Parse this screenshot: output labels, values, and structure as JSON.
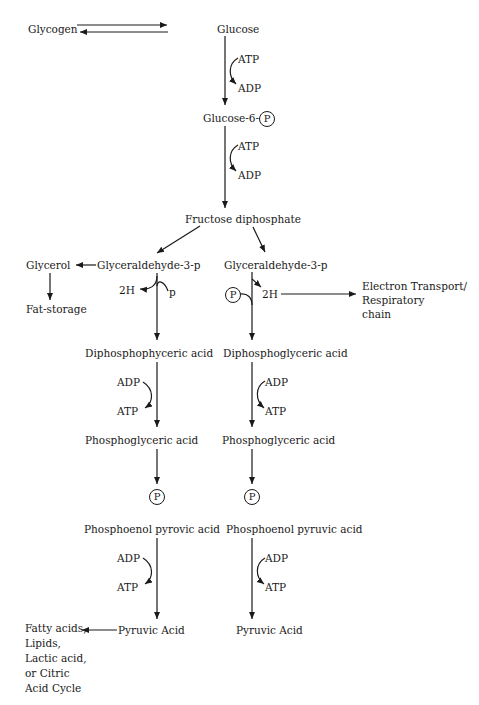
{
  "diagram": {
    "phosphate_symbol": "P",
    "top": {
      "glycogen": "Glycogen",
      "glucose": "Glucose",
      "atp1": "ATP",
      "adp1": "ADP",
      "glucose6p": "Glucose-6-",
      "atp2": "ATP",
      "adp2": "ADP",
      "fructose": "Fructose diphosphate"
    },
    "left_branch": {
      "glycerol": "Glycerol",
      "fat_storage": "Fat-storage",
      "g3p": "Glyceraldehyde-3-p",
      "two_h": "2H",
      "p_small": "p",
      "dpg": "Diphosphophyceric acid",
      "adp": "ADP",
      "atp": "ATP",
      "pga": "Phosphoglyceric acid",
      "pep": "Phosphoenol pyrovic acid",
      "adp2": "ADP",
      "atp2": "ATP",
      "pyruvic": "Pyruvic Acid",
      "fates": [
        "Fatty acids,",
        "Lipids,",
        "Lactic acid,",
        "or Citric",
        "Acid Cycle"
      ]
    },
    "right_branch": {
      "g3p": "Glyceraldehyde-3-p",
      "two_h": "2H",
      "electron_transport": [
        "Electron Transport/",
        "Respiratory",
        "chain"
      ],
      "dpg": "Diphosphoglyceric acid",
      "adp": "ADP",
      "atp": "ATP",
      "pga": "Phosphoglyceric acid",
      "pep": "Phosphoenol pyruvic acid",
      "adp2": "ADP",
      "atp2": "ATP",
      "pyruvic": "Pyruvic Acid"
    }
  }
}
